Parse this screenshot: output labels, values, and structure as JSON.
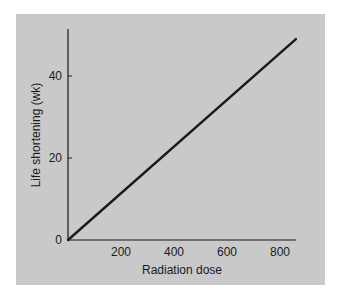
{
  "chart_data": {
    "type": "line",
    "title": "",
    "xlabel": "Radiation dose",
    "ylabel": "Life shortening (wk)",
    "xlim": [
      0,
      870
    ],
    "ylim": [
      0,
      52
    ],
    "x_ticks": [
      200,
      400,
      600,
      800
    ],
    "y_ticks": [
      0,
      20,
      40
    ],
    "grid": false,
    "legend": null,
    "series": [
      {
        "name": "Life shortening vs dose",
        "x": [
          0,
          860
        ],
        "y": [
          0,
          49
        ]
      }
    ]
  },
  "colors": {
    "panel_background": "#c9c9c9",
    "line": "#1a1a1a",
    "axis": "#1a1a1a"
  }
}
